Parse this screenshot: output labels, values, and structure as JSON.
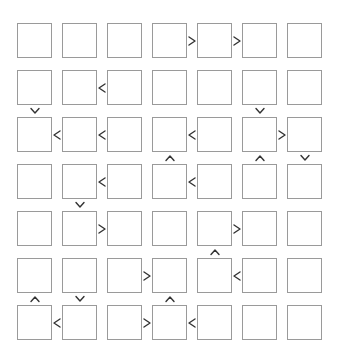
{
  "puzzle": {
    "type": "futoshiki",
    "size": 7,
    "grid": {
      "origin_x": 17,
      "origin_y": 23,
      "pitch_x": 45,
      "pitch_y": 47,
      "cell_size": 35
    },
    "colors": {
      "cell_border": "#9a9a9a",
      "sign": "#333333",
      "background": "#ffffff"
    },
    "cells": [
      [
        "",
        "",
        "",
        "",
        "",
        "",
        ""
      ],
      [
        "",
        "",
        "",
        "",
        "",
        "",
        ""
      ],
      [
        "",
        "",
        "",
        "",
        "",
        "",
        ""
      ],
      [
        "",
        "",
        "",
        "",
        "",
        "",
        ""
      ],
      [
        "",
        "",
        "",
        "",
        "",
        "",
        ""
      ],
      [
        "",
        "",
        "",
        "",
        "",
        "",
        ""
      ],
      [
        "",
        "",
        "",
        "",
        "",
        "",
        ""
      ]
    ],
    "horizontal_constraints": [
      {
        "row": 1,
        "between_cols": [
          4,
          5
        ],
        "sign": ">"
      },
      {
        "row": 1,
        "between_cols": [
          5,
          6
        ],
        "sign": ">"
      },
      {
        "row": 2,
        "between_cols": [
          2,
          3
        ],
        "sign": "<"
      },
      {
        "row": 3,
        "between_cols": [
          1,
          2
        ],
        "sign": "<"
      },
      {
        "row": 3,
        "between_cols": [
          2,
          3
        ],
        "sign": "<"
      },
      {
        "row": 3,
        "between_cols": [
          4,
          5
        ],
        "sign": "<"
      },
      {
        "row": 3,
        "between_cols": [
          6,
          7
        ],
        "sign": ">"
      },
      {
        "row": 4,
        "between_cols": [
          2,
          3
        ],
        "sign": "<"
      },
      {
        "row": 4,
        "between_cols": [
          4,
          5
        ],
        "sign": "<"
      },
      {
        "row": 5,
        "between_cols": [
          2,
          3
        ],
        "sign": ">"
      },
      {
        "row": 5,
        "between_cols": [
          5,
          6
        ],
        "sign": ">"
      },
      {
        "row": 6,
        "between_cols": [
          3,
          4
        ],
        "sign": ">"
      },
      {
        "row": 6,
        "between_cols": [
          5,
          6
        ],
        "sign": "<"
      },
      {
        "row": 7,
        "between_cols": [
          1,
          2
        ],
        "sign": "<"
      },
      {
        "row": 7,
        "between_cols": [
          3,
          4
        ],
        "sign": ">"
      },
      {
        "row": 7,
        "between_cols": [
          4,
          5
        ],
        "sign": "<"
      }
    ],
    "vertical_constraints": [
      {
        "col": 1,
        "between_rows": [
          2,
          3
        ],
        "sign": "v"
      },
      {
        "col": 6,
        "between_rows": [
          2,
          3
        ],
        "sign": "v"
      },
      {
        "col": 4,
        "between_rows": [
          3,
          4
        ],
        "sign": "^"
      },
      {
        "col": 6,
        "between_rows": [
          3,
          4
        ],
        "sign": "^"
      },
      {
        "col": 7,
        "between_rows": [
          3,
          4
        ],
        "sign": "v"
      },
      {
        "col": 2,
        "between_rows": [
          4,
          5
        ],
        "sign": "v"
      },
      {
        "col": 5,
        "between_rows": [
          5,
          6
        ],
        "sign": "^"
      },
      {
        "col": 1,
        "between_rows": [
          6,
          7
        ],
        "sign": "^"
      },
      {
        "col": 2,
        "between_rows": [
          6,
          7
        ],
        "sign": "v"
      },
      {
        "col": 4,
        "between_rows": [
          6,
          7
        ],
        "sign": "^"
      }
    ]
  }
}
